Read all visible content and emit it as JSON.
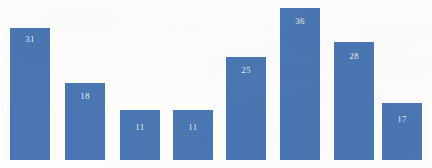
{
  "figure": {
    "background_color": "#fdfdfc",
    "bar_color": "#4a77b3",
    "label_color": "#ffffff",
    "baseline_y_px": 160,
    "bar_width_px": 40,
    "bar_gap_px": 14
  },
  "chart_data": {
    "type": "bar",
    "title": "",
    "subtitle": "",
    "xlabel": "",
    "ylabel": "",
    "grid": false,
    "legend": false,
    "legend_position": "none",
    "axis_visible": false,
    "tick_labels_visible": false,
    "data_labels_visible": true,
    "data_label_position": "inside-top",
    "ylim": [
      0,
      36
    ],
    "categories": [
      "1",
      "2",
      "3",
      "4",
      "5",
      "6",
      "7",
      "8"
    ],
    "values": [
      31,
      18,
      11,
      11,
      25,
      36,
      28,
      17
    ],
    "bars": [
      {
        "index": 1,
        "value": 31,
        "label": "31",
        "x_px": 10,
        "width_px": 40,
        "top_px": 28,
        "height_px": 132
      },
      {
        "index": 2,
        "value": 18,
        "label": "18",
        "x_px": 65,
        "width_px": 40,
        "top_px": 83,
        "height_px": 77
      },
      {
        "index": 3,
        "value": 11,
        "label": "11",
        "x_px": 120,
        "width_px": 40,
        "top_px": 110,
        "height_px": 50
      },
      {
        "index": 4,
        "value": 11,
        "label": "11",
        "x_px": 173,
        "width_px": 40,
        "top_px": 110,
        "height_px": 50
      },
      {
        "index": 5,
        "value": 25,
        "label": "25",
        "x_px": 226,
        "width_px": 40,
        "top_px": 57,
        "height_px": 103
      },
      {
        "index": 6,
        "value": 36,
        "label": "36",
        "x_px": 280,
        "width_px": 40,
        "top_px": 8,
        "height_px": 152
      },
      {
        "index": 7,
        "value": 28,
        "label": "28",
        "x_px": 334,
        "width_px": 40,
        "top_px": 42,
        "height_px": 118
      },
      {
        "index": 8,
        "value": 17,
        "label": "17",
        "x_px": 382,
        "width_px": 40,
        "top_px": 103,
        "height_px": 57
      }
    ]
  }
}
